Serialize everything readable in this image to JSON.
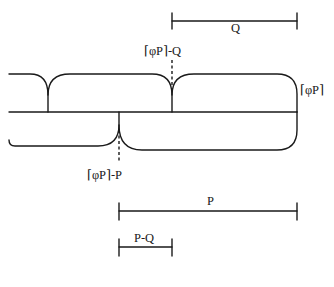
{
  "diagram": {
    "type": "interval-tiling diagram",
    "stroke_color": "#1a1a1a",
    "background": "#ffffff",
    "labels": {
      "q_interval": "Q",
      "cusp_top": "⌈φP⌉-Q",
      "right_edge": "⌈φP⌉",
      "cusp_bottom": "⌈φP⌉-P",
      "p_interval": "P",
      "p_minus_q_interval": "P-Q"
    },
    "intervals": [
      {
        "name": "Q",
        "x_start": 172,
        "x_end": 297,
        "y": 21
      },
      {
        "name": "P",
        "x_start": 119,
        "x_end": 297,
        "y": 211
      },
      {
        "name": "P-Q",
        "x_start": 119,
        "x_end": 172,
        "y": 247
      }
    ],
    "rows": [
      {
        "name": "top-row",
        "cusps_x": [
          48,
          172
        ],
        "right_edge_x": 297
      },
      {
        "name": "bottom-row",
        "cusps_x": [
          119
        ],
        "right_edge_x": 297
      }
    ]
  }
}
